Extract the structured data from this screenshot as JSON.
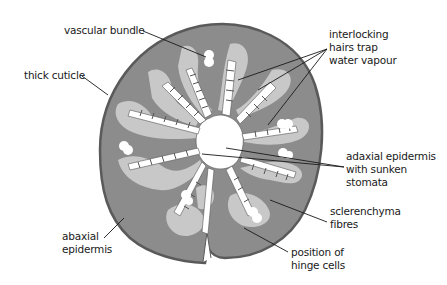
{
  "diagram": {
    "colors": {
      "background": "#ffffff",
      "cuticle": "#5a5a5a",
      "mesophyll": "#8c8c8c",
      "sclerenchyma": "#c8c8c8",
      "hairs": "#ffffff",
      "hair_lines": "#555555",
      "leader_line": "#1a1a1a",
      "text": "#1a1a1a"
    },
    "labels": [
      {
        "id": "vascular-bundle",
        "text": "vascular bundle",
        "x": 64,
        "y": 24
      },
      {
        "id": "thick-cuticle",
        "text": "thick cuticle",
        "x": 24,
        "y": 69
      },
      {
        "id": "interlocking-hairs",
        "text": "interlocking\nhairs trap\nwater vapour",
        "x": 329,
        "y": 28
      },
      {
        "id": "adaxial-epidermis",
        "text": "adaxial epidermis\nwith sunken\nstomata",
        "x": 346,
        "y": 150
      },
      {
        "id": "sclerenchyma",
        "text": "sclerenchyma\nfibres",
        "x": 330,
        "y": 205
      },
      {
        "id": "abaxial-epidermis",
        "text": "abaxial\nepidermis",
        "x": 62,
        "y": 230
      },
      {
        "id": "hinge-cells",
        "text": "position of\nhinge cells",
        "x": 291,
        "y": 246
      }
    ]
  }
}
